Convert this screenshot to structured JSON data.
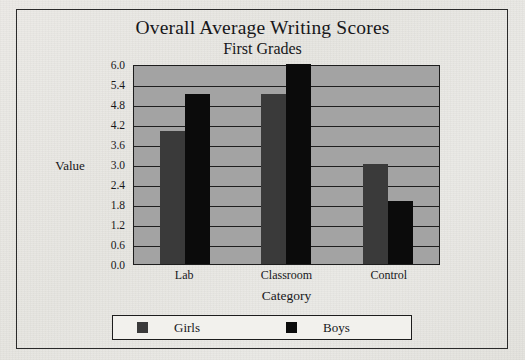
{
  "chart_data": {
    "type": "bar",
    "title": "Overall Average Writing Scores",
    "subtitle": "First Grades",
    "xlabel": "Category",
    "ylabel": "Value",
    "categories": [
      "Lab",
      "Classroom",
      "Control"
    ],
    "series": [
      {
        "name": "Girls",
        "color": "#3a3a3a",
        "values": [
          4.0,
          5.1,
          3.0
        ]
      },
      {
        "name": "Boys",
        "color": "#0b0b0b",
        "values": [
          5.1,
          6.0,
          1.9
        ]
      }
    ],
    "ylim": [
      0.0,
      6.0
    ],
    "ytick_step": 0.6,
    "yticks": [
      "6.0",
      "5.4",
      "4.8",
      "4.2",
      "3.6",
      "3.0",
      "2.4",
      "1.8",
      "1.2",
      "0.6",
      "0.0"
    ],
    "grid": true,
    "legend_position": "bottom",
    "plot_background": "#a3a3a3",
    "figure_background": "#eceae6"
  }
}
